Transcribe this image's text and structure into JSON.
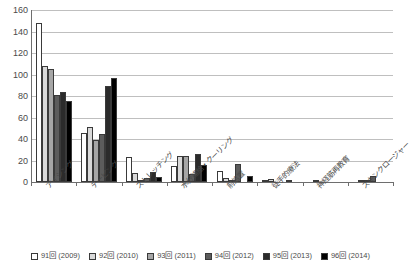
{
  "chart_data": {
    "type": "bar",
    "title": "",
    "xlabel": "",
    "ylabel": "",
    "ylim": [
      0,
      160
    ],
    "ytick_step": 20,
    "yticks": [
      "0",
      "20",
      "40",
      "60",
      "80",
      "100",
      "120",
      "140",
      "160"
    ],
    "grid": true,
    "legend_position": "bottom",
    "categories": [
      "アイシング",
      "テーピング",
      "ストレッチング",
      "水分補給・クーリング",
      "前処置",
      "徒手的療法",
      "神経筋再教育",
      "スキンクロージャー"
    ],
    "series": [
      {
        "name": "91回 (2009)",
        "color": "#ffffff",
        "values": [
          148,
          46,
          23,
          15,
          10,
          2,
          0,
          0
        ]
      },
      {
        "name": "92回 (2010)",
        "color": "#d9d9d9",
        "values": [
          108,
          51,
          8,
          24,
          4,
          3,
          2,
          1
        ]
      },
      {
        "name": "93回 (2011)",
        "color": "#a6a6a6",
        "values": [
          105,
          39,
          1,
          24,
          1,
          0,
          0,
          1
        ]
      },
      {
        "name": "94回 (2012)",
        "color": "#5c5c5c",
        "values": [
          81,
          45,
          4,
          7,
          17,
          0,
          0,
          6
        ]
      },
      {
        "name": "95回 (2013)",
        "color": "#2b2b2b",
        "values": [
          84,
          89,
          9,
          26,
          0,
          1,
          0,
          0
        ]
      },
      {
        "name": "96回 (2014)",
        "color": "#000000",
        "values": [
          75,
          97,
          5,
          16,
          6,
          0,
          0,
          0
        ]
      }
    ]
  }
}
